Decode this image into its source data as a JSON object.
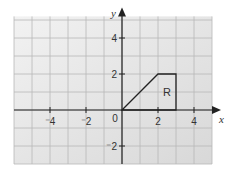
{
  "chart_data": {
    "type": "diagram",
    "title": "",
    "xlabel": "x",
    "ylabel": "y",
    "xlim": [
      -6,
      5
    ],
    "ylim": [
      -3,
      5.2
    ],
    "grid": true,
    "x_tick_labels": [
      {
        "value": -4,
        "label": "-4"
      },
      {
        "value": -2,
        "label": "-2"
      },
      {
        "value": 2,
        "label": "2"
      },
      {
        "value": 4,
        "label": "4"
      }
    ],
    "y_tick_labels": [
      {
        "value": 4,
        "label": "4"
      },
      {
        "value": 2,
        "label": "2"
      },
      {
        "value": -2,
        "label": "-2"
      }
    ],
    "origin_label": "0",
    "shape": {
      "label": "R",
      "label_position": [
        2.5,
        1
      ],
      "vertices": [
        [
          0,
          0
        ],
        [
          2,
          2
        ],
        [
          3,
          2
        ],
        [
          3,
          0
        ]
      ]
    }
  },
  "colors": {
    "grid_background": "#e4e4e4",
    "grid_line": "#b8b8b8",
    "axis": "#222222",
    "shape_stroke": "#222222"
  }
}
